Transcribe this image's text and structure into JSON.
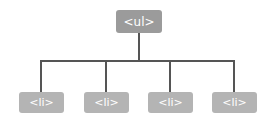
{
  "diagram": {
    "type": "tree",
    "root": {
      "label": "<ul>"
    },
    "children": [
      {
        "label": "<li>"
      },
      {
        "label": "<li>"
      },
      {
        "label": "<li>"
      },
      {
        "label": "<li>"
      }
    ],
    "colors": {
      "root_fill": "#9b9b9b",
      "child_fill": "#b4b4b4",
      "connector": "#555555",
      "text": "#ffffff"
    }
  }
}
